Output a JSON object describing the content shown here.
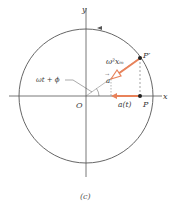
{
  "figure": {
    "caption": "(c)",
    "colors": {
      "circle": "#555555",
      "axes": "#555555",
      "arrow": "#e8825a",
      "arrow_head_fill": "#ffffff",
      "point": "#222222",
      "dashed": "#666666"
    },
    "axes": {
      "x_label": "x",
      "y_label": "y",
      "origin_label": "O"
    },
    "points": {
      "p_prime_label": "P′",
      "p_label": "P"
    },
    "labels": {
      "accel_magnitude": "ω²xₘ",
      "accel_vector": "a",
      "angle": "ωt + ϕ",
      "projection": "a(t)"
    }
  }
}
